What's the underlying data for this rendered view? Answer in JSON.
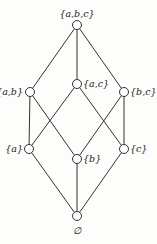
{
  "diagram": {
    "type": "hasse",
    "nodes": [
      {
        "id": "abc",
        "label": "{a,b,c}",
        "x": 77,
        "y": 25,
        "lx": 77,
        "ly": 17,
        "anchor": "middle"
      },
      {
        "id": "ab",
        "label": "{a,b}",
        "x": 30,
        "y": 92,
        "lx": 23,
        "ly": 95,
        "anchor": "end"
      },
      {
        "id": "ac",
        "label": "{a,c}",
        "x": 77,
        "y": 84,
        "lx": 83,
        "ly": 87,
        "anchor": "start"
      },
      {
        "id": "bc",
        "label": "{b,c}",
        "x": 124,
        "y": 92,
        "lx": 130,
        "ly": 95,
        "anchor": "start"
      },
      {
        "id": "a",
        "label": "{a}",
        "x": 29,
        "y": 149,
        "lx": 23,
        "ly": 152,
        "anchor": "end"
      },
      {
        "id": "b",
        "label": "{b}",
        "x": 77,
        "y": 159,
        "lx": 83,
        "ly": 162,
        "anchor": "start"
      },
      {
        "id": "c",
        "label": "{c}",
        "x": 124,
        "y": 149,
        "lx": 130,
        "ly": 152,
        "anchor": "start"
      },
      {
        "id": "empty",
        "label": "∅",
        "x": 77,
        "y": 216,
        "lx": 77,
        "ly": 234,
        "anchor": "middle"
      }
    ],
    "edges": [
      [
        "abc",
        "ab"
      ],
      [
        "abc",
        "ac"
      ],
      [
        "abc",
        "bc"
      ],
      [
        "ab",
        "a"
      ],
      [
        "ab",
        "b"
      ],
      [
        "ac",
        "a"
      ],
      [
        "ac",
        "c"
      ],
      [
        "bc",
        "b"
      ],
      [
        "bc",
        "c"
      ],
      [
        "a",
        "empty"
      ],
      [
        "b",
        "empty"
      ],
      [
        "c",
        "empty"
      ]
    ]
  }
}
